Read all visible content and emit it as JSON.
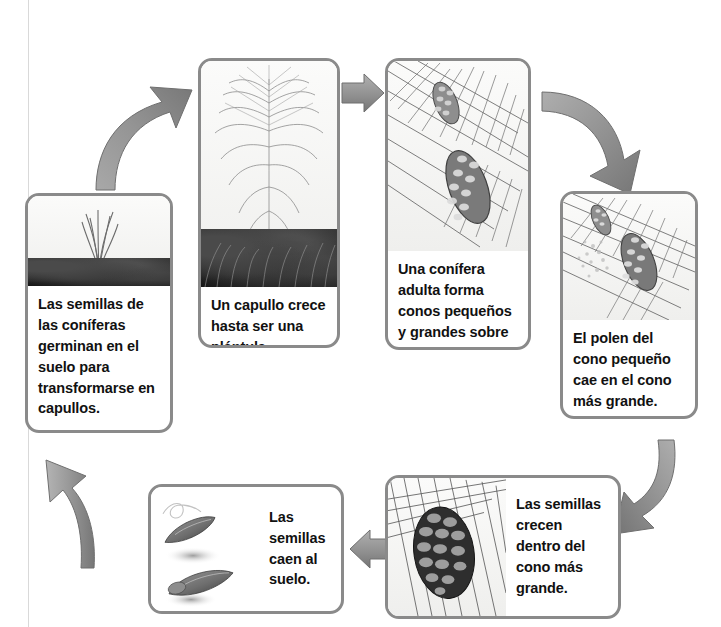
{
  "diagram": {
    "type": "life-cycle",
    "flow_direction": "clockwise",
    "border_color": "#8a8a8a",
    "arrow_color": "#8e8e8e",
    "background_color": "#ffffff",
    "text_color": "#111111"
  },
  "steps": [
    {
      "id": "step-1",
      "order": 1,
      "caption": "Las semillas de las coníferas germinan en el suelo para transformarse en capullos.",
      "image_name": "seedling-sprouting-in-soil",
      "layout": "vertical"
    },
    {
      "id": "step-2",
      "order": 2,
      "caption": "Un capullo crece hasta ser una plántula.",
      "image_name": "young-pine-sapling-in-grass",
      "layout": "vertical"
    },
    {
      "id": "step-3",
      "order": 3,
      "caption": "Una conífera adulta forma conos pequeños y grandes sobre sus ramas.",
      "image_name": "pine-branch-with-small-and-large-cones",
      "layout": "vertical"
    },
    {
      "id": "step-4",
      "order": 4,
      "caption": "El polen del cono pequeño cae en el cono más grande.",
      "image_name": "pollen-falling-from-small-cone-onto-large-cone",
      "layout": "vertical"
    },
    {
      "id": "step-5",
      "order": 5,
      "caption": "Las semillas crecen dentro del cono más grande.",
      "image_name": "mature-pine-cone-with-seeds",
      "layout": "horizontal"
    },
    {
      "id": "step-6",
      "order": 6,
      "caption": "Las semillas caen al suelo.",
      "image_name": "winged-pine-seeds-falling",
      "layout": "horizontal"
    }
  ],
  "arrows": [
    {
      "id": "arrow-1-to-2",
      "from": "step-1",
      "to": "step-2",
      "direction": "up-right",
      "name": "arrow-seedling-to-sapling"
    },
    {
      "id": "arrow-2-to-3",
      "from": "step-2",
      "to": "step-3",
      "direction": "right",
      "name": "arrow-sapling-to-adult"
    },
    {
      "id": "arrow-3-to-4",
      "from": "step-3",
      "to": "step-4",
      "direction": "down-right",
      "name": "arrow-adult-to-pollen"
    },
    {
      "id": "arrow-4-to-5",
      "from": "step-4",
      "to": "step-5",
      "direction": "down-left",
      "name": "arrow-pollen-to-seeds"
    },
    {
      "id": "arrow-5-to-6",
      "from": "step-5",
      "to": "step-6",
      "direction": "left",
      "name": "arrow-seeds-to-falling"
    },
    {
      "id": "arrow-6-to-1",
      "from": "step-6",
      "to": "step-1",
      "direction": "up-left",
      "name": "arrow-falling-to-seedling"
    }
  ]
}
